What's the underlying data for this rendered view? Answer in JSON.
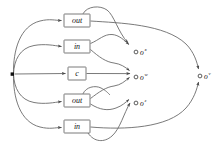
{
  "diagram": {
    "background_color": "#ffffff",
    "edge_color": "#6b6b6b",
    "node_stroke_color": "#6b6b6b",
    "label_color": "#111111",
    "source": {
      "name": "source-node",
      "shape": "filled-square",
      "x": 12,
      "y": 74,
      "size": 3.2
    },
    "boxes": [
      {
        "id": "box-out-1",
        "label": "out",
        "x": 64,
        "y": 14,
        "w": 26,
        "h": 13
      },
      {
        "id": "box-in-1",
        "label": "in",
        "x": 64,
        "y": 40,
        "w": 26,
        "h": 13
      },
      {
        "id": "box-c",
        "label": "c",
        "x": 68,
        "y": 67,
        "w": 18,
        "h": 13
      },
      {
        "id": "box-out-2",
        "label": "out",
        "x": 64,
        "y": 94,
        "w": 26,
        "h": 13
      },
      {
        "id": "box-in-2",
        "label": "in",
        "x": 64,
        "y": 120,
        "w": 26,
        "h": 13
      }
    ],
    "outputs": [
      {
        "id": "output-x",
        "base": "o",
        "sup": "x",
        "cx": 138,
        "cy": 50
      },
      {
        "id": "output-w",
        "base": "o",
        "sup": "w",
        "cx": 138,
        "cy": 76
      },
      {
        "id": "output-z",
        "base": "o",
        "sup": "z",
        "cx": 138,
        "cy": 102
      },
      {
        "id": "output-v",
        "base": "o",
        "sup": "v",
        "cx": 202,
        "cy": 76
      }
    ]
  }
}
